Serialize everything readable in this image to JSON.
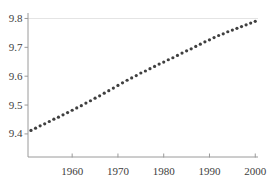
{
  "figure": {
    "background": "#ffffff",
    "title": "",
    "legend": "none"
  },
  "chart_data": {
    "type": "scatter",
    "title": "",
    "xlabel": "",
    "ylabel": "",
    "marker": {
      "shape": "dot",
      "radius_px": 1.6,
      "color": "#3f3f3f"
    },
    "xlim": [
      1950.35,
      2000.6
    ],
    "ylim": [
      9.32,
      9.819
    ],
    "xticks": [
      1960,
      1970,
      1980,
      1990,
      2000
    ],
    "xtick_labels": [
      "1960",
      "1970",
      "1980",
      "1990",
      "2000"
    ],
    "yticks": [
      9.4,
      9.5,
      9.6,
      9.7,
      9.8
    ],
    "ytick_labels": [
      "9.4",
      "9.5",
      "9.6",
      "9.7",
      "9.8"
    ],
    "gridlines_y": [
      9.8
    ],
    "x": [
      1951,
      1952,
      1953,
      1954,
      1955,
      1956,
      1957,
      1958,
      1959,
      1960,
      1961,
      1962,
      1963,
      1964,
      1965,
      1966,
      1967,
      1968,
      1969,
      1970,
      1971,
      1972,
      1973,
      1974,
      1975,
      1976,
      1977,
      1978,
      1979,
      1980,
      1981,
      1982,
      1983,
      1984,
      1985,
      1986,
      1987,
      1988,
      1989,
      1990,
      1991,
      1992,
      1993,
      1994,
      1995,
      1996,
      1997,
      1998,
      1999,
      2000
    ],
    "y": [
      9.412,
      9.42,
      9.428,
      9.435,
      9.443,
      9.451,
      9.458,
      9.466,
      9.474,
      9.482,
      9.49,
      9.498,
      9.507,
      9.515,
      9.524,
      9.532,
      9.541,
      9.55,
      9.559,
      9.568,
      9.577,
      9.586,
      9.594,
      9.602,
      9.611,
      9.618,
      9.626,
      9.634,
      9.642,
      9.649,
      9.657,
      9.664,
      9.672,
      9.68,
      9.688,
      9.695,
      9.703,
      9.711,
      9.719,
      9.726,
      9.734,
      9.741,
      9.747,
      9.754,
      9.76,
      9.766,
      9.772,
      9.778,
      9.784,
      9.79
    ],
    "colors": {
      "axis": "#9a9a9a",
      "tick": "#9a9a9a",
      "tick_label": "#3d3d3d",
      "gridline": "#e4e4e4",
      "point": "#3f3f3f",
      "background": "#ffffff"
    }
  }
}
